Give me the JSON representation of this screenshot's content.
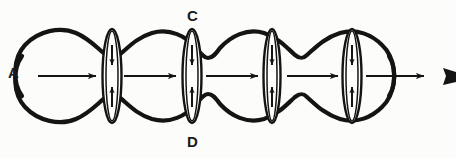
{
  "figure": {
    "domain": "diagram",
    "title_visible": false,
    "background_color": "#fcfcfb",
    "ink_color": "#141412",
    "width": 456,
    "height": 158
  },
  "labels": [
    {
      "id": "A",
      "text": "A",
      "position": "left-outside",
      "x": 8,
      "y": 65
    },
    {
      "id": "C",
      "text": "C",
      "position": "top-center",
      "x": 187,
      "y": 8
    },
    {
      "id": "D",
      "text": "D",
      "position": "bottom-center",
      "x": 187,
      "y": 134
    }
  ],
  "geometry": {
    "axis_y": 76,
    "bulges": [
      {
        "index": 1,
        "cx": 62,
        "rx": 44,
        "ry": 48
      },
      {
        "index": 2,
        "cx": 143,
        "rx": 42,
        "ry": 40
      },
      {
        "index": 3,
        "cx": 225,
        "rx": 42,
        "ry": 40
      },
      {
        "index": 4,
        "cx": 307,
        "rx": 42,
        "ry": 40
      },
      {
        "index": 5,
        "cx": 390,
        "rx": 44,
        "ry": 48
      }
    ],
    "constrictions": [
      {
        "index": 1,
        "cx": 112,
        "rx": 9,
        "ry": 47
      },
      {
        "index": 2,
        "cx": 192,
        "rx": 9,
        "ry": 47
      },
      {
        "index": 3,
        "cx": 272,
        "rx": 8,
        "ry": 47
      },
      {
        "index": 4,
        "cx": 352,
        "rx": 9,
        "ry": 47
      }
    ],
    "flow_arrows": [
      {
        "index": 1,
        "x1": 38,
        "x2": 96,
        "y": 76
      },
      {
        "index": 2,
        "x1": 124,
        "x2": 176,
        "y": 76
      },
      {
        "index": 3,
        "x1": 206,
        "x2": 258,
        "y": 76
      },
      {
        "index": 4,
        "x1": 287,
        "x2": 338,
        "y": 76
      },
      {
        "index": 5,
        "x1": 366,
        "x2": 424,
        "y": 76
      }
    ],
    "exit_marker": {
      "x": 448,
      "y": 76,
      "shape": "solid-triangle-right"
    }
  },
  "annotations": {
    "flow_direction": "left-to-right",
    "constriction_arrow_direction": "inward-toward-axis",
    "arrow_count_horizontal": 5,
    "constriction_count": 4,
    "bulge_count": 5
  }
}
